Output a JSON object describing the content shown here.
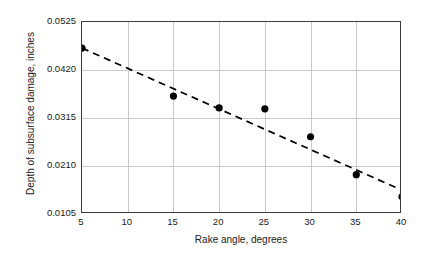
{
  "chart_data": {
    "type": "scatter",
    "title": "",
    "subtitle": "",
    "xlabel": "Rake angle, degrees",
    "ylabel": "Depth of subsurface damage, inches",
    "xlim": [
      5,
      40
    ],
    "ylim": [
      0.0105,
      0.0525
    ],
    "xticks": [
      5,
      10,
      15,
      20,
      25,
      30,
      35,
      40
    ],
    "xtick_labels": [
      "5",
      "10",
      "15",
      "20",
      "25",
      "30",
      "35",
      "40"
    ],
    "yticks": [
      0.0105,
      0.021,
      0.0315,
      0.042,
      0.0525
    ],
    "ytick_labels": [
      "0.0105",
      "0.0210",
      "0.0315",
      "0.0420",
      "0.0525"
    ],
    "grid": true,
    "grid_color": "#c9c9c9",
    "legend": false,
    "legend_position": "none",
    "marker_color": "#000000",
    "marker_shape": "circle",
    "frame_color": "#3a3a3a",
    "background_color": "#ffffff",
    "series": [
      {
        "name": "Measured depth of subsurface damage",
        "style": "markers",
        "x": [
          5,
          15,
          20,
          25,
          30,
          35,
          40
        ],
        "y": [
          0.0468,
          0.0363,
          0.0337,
          0.0335,
          0.0274,
          0.0191,
          0.0143
        ],
        "points": [
          {
            "x": 5,
            "y": 0.0468
          },
          {
            "x": 15,
            "y": 0.0363
          },
          {
            "x": 20,
            "y": 0.0337
          },
          {
            "x": 25,
            "y": 0.0335
          },
          {
            "x": 30,
            "y": 0.0274
          },
          {
            "x": 35,
            "y": 0.0191
          },
          {
            "x": 40,
            "y": 0.0143
          }
        ]
      },
      {
        "name": "Fitted trend line",
        "style": "dashed-line",
        "line_color": "#000000",
        "dash": "7,5",
        "x": [
          5,
          40
        ],
        "y": [
          0.0468,
          0.0157
        ]
      }
    ]
  }
}
